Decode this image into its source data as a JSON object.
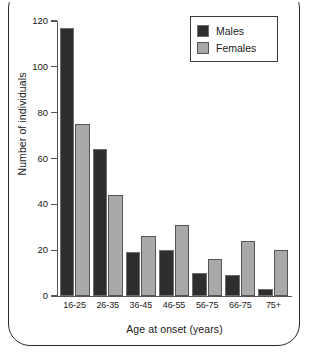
{
  "chart_data": {
    "type": "bar",
    "title": "",
    "xlabel": "Age at onset (years)",
    "ylabel": "Number of individuals",
    "categories": [
      "16-25",
      "26-35",
      "36-45",
      "46-55",
      "56-75",
      "66-75",
      "75+"
    ],
    "series": [
      {
        "name": "Males",
        "color": "#2e2e2e",
        "values": [
          117,
          64,
          19,
          20,
          10,
          9,
          3
        ]
      },
      {
        "name": "Females",
        "color": "#a9a9a9",
        "values": [
          75,
          44,
          26,
          31,
          16,
          24,
          20
        ]
      }
    ],
    "ylim": [
      0,
      120
    ],
    "yticks": [
      0,
      20,
      40,
      60,
      80,
      100,
      120
    ],
    "ytick_labels": [
      "0",
      "20",
      "40",
      "60",
      "80",
      "100",
      "120"
    ],
    "grid": false,
    "legend_position": "top-right",
    "legend_entries": [
      "Males",
      "Females"
    ]
  },
  "figure": {
    "frame_color": "#2b2b2b",
    "background": "#ffffff"
  }
}
